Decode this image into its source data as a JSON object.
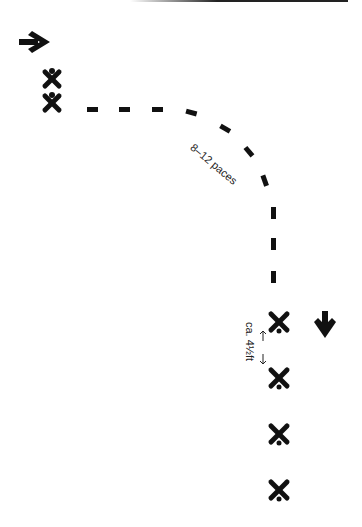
{
  "diagram": {
    "paces_label": "8–12 paces",
    "distance_label": "ca. 4½ft",
    "arrows": [
      {
        "name": "arrow-right-icon",
        "direction": "right"
      },
      {
        "name": "arrow-down-icon",
        "direction": "down"
      }
    ],
    "figures_start": 2,
    "figures_end": 4,
    "colors": {
      "ink": "#111111",
      "background": "#ffffff"
    }
  }
}
